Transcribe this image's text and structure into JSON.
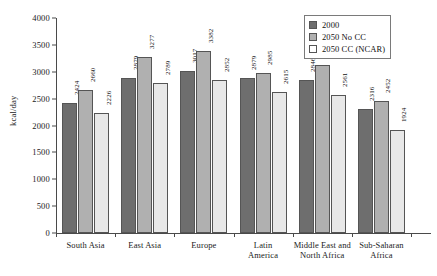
{
  "chart_data": {
    "type": "bar",
    "title": "",
    "xlabel": "",
    "ylabel": "kcal/day",
    "ylim": [
      0,
      4000
    ],
    "yticks": [
      0,
      500,
      1000,
      1500,
      2000,
      2500,
      3000,
      3500,
      4000
    ],
    "ytick_labels": [
      "0",
      "500",
      "1000",
      "1500",
      "2000",
      "2500",
      "3000",
      "3500",
      "4000"
    ],
    "grid": false,
    "legend_position": "top-right",
    "categories": [
      "South Asia",
      "East Asia",
      "Europe",
      "Latin America",
      "Middle East and North Africa",
      "Sub-Saharan Africa"
    ],
    "category_lines": [
      [
        "South Asia"
      ],
      [
        "East Asia"
      ],
      [
        "Europe"
      ],
      [
        "Latin",
        "America"
      ],
      [
        "Middle East and",
        "North Africa"
      ],
      [
        "Sub-Saharan",
        "Africa"
      ]
    ],
    "series": [
      {
        "name": "2000",
        "color": "#6e6e6e",
        "values": [
          2424,
          2879,
          3017,
          2879,
          2846,
          2316
        ]
      },
      {
        "name": "2050 No CC",
        "color": "#b0b0b0",
        "values": [
          2660,
          3277,
          3382,
          2985,
          3119,
          2452
        ]
      },
      {
        "name": "2050 CC (NCAR)",
        "color": "#e8e8e8",
        "values": [
          2226,
          2789,
          2852,
          2615,
          2561,
          1924
        ]
      }
    ]
  },
  "legend": {
    "items": [
      {
        "label": "2000"
      },
      {
        "label": "2050 No CC"
      },
      {
        "label": "2050 CC (NCAR)"
      }
    ]
  }
}
